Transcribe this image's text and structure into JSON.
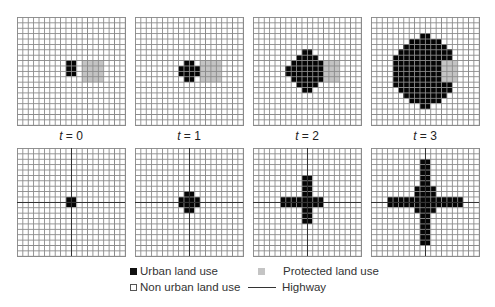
{
  "grid_size": 20,
  "colors": {
    "urban": "#050505",
    "protected": "#c4c4c4",
    "non_urban": "#ffffff",
    "grid_line": "#8a8a8a",
    "highway": "#333333"
  },
  "top_row": {
    "description": "Urban growth with protected land use",
    "panels": [
      {
        "label_var": "t",
        "label_eq": " = 0",
        "urban": {
          "8": [
            9,
            10
          ],
          "9": [
            9,
            10
          ],
          "10": [
            9,
            10
          ]
        },
        "protected_rect": {
          "row0": 8,
          "row1": 11,
          "col0": 12,
          "col1": 15
        }
      },
      {
        "label_var": "t",
        "label_eq": " = 1",
        "urban": {
          "8": [
            9,
            10
          ],
          "9": [
            8,
            11
          ],
          "10": [
            8,
            11
          ],
          "11": [
            9,
            10
          ]
        },
        "protected_rect": {
          "row0": 8,
          "row1": 11,
          "col0": 12,
          "col1": 15
        }
      },
      {
        "label_var": "t",
        "label_eq": " = 2",
        "urban": {
          "6": [
            9,
            10
          ],
          "7": [
            8,
            11
          ],
          "8": [
            7,
            12
          ],
          "9": [
            6,
            12
          ],
          "10": [
            6,
            12
          ],
          "11": [
            7,
            12
          ],
          "12": [
            8,
            11
          ],
          "13": [
            9,
            10
          ]
        },
        "protected_rect": {
          "row0": 8,
          "row1": 11,
          "col0": 13,
          "col1": 15
        }
      },
      {
        "label_var": "t",
        "label_eq": " = 3",
        "urban": {
          "3": [
            9,
            10
          ],
          "4": [
            7,
            12
          ],
          "5": [
            6,
            13
          ],
          "6": [
            5,
            14
          ],
          "7": [
            4,
            14
          ],
          "8": [
            4,
            12
          ],
          "9": [
            4,
            12
          ],
          "10": [
            4,
            12
          ],
          "11": [
            4,
            12
          ],
          "12": [
            4,
            14
          ],
          "13": [
            5,
            14
          ],
          "14": [
            6,
            13
          ],
          "15": [
            7,
            12
          ],
          "16": [
            9,
            10
          ]
        },
        "protected_rect": {
          "row0": 8,
          "row1": 11,
          "col0": 13,
          "col1": 15
        }
      }
    ]
  },
  "bottom_row": {
    "description": "Urban growth along highways",
    "panels": [
      {
        "urban": {
          "9": [
            9,
            10
          ],
          "10": [
            9,
            10
          ]
        },
        "vertical": [],
        "highway": true
      },
      {
        "urban": {
          "8": [
            9,
            10
          ],
          "9": [
            8,
            11
          ],
          "10": [
            8,
            11
          ],
          "11": [
            9,
            10
          ]
        },
        "highway": true
      },
      {
        "urban": {
          "5": [
            9,
            10
          ],
          "6": [
            9,
            10
          ],
          "7": [
            9,
            10
          ],
          "8": [
            9,
            10
          ],
          "9": [
            5,
            12
          ],
          "10": [
            5,
            12
          ],
          "11": [
            9,
            10
          ],
          "12": [
            9,
            10
          ],
          "13": [
            9,
            10
          ]
        },
        "highway": true
      },
      {
        "urban": {
          "2": [
            9,
            10
          ],
          "3": [
            9,
            10
          ],
          "4": [
            9,
            10
          ],
          "5": [
            9,
            10
          ],
          "6": [
            9,
            10
          ],
          "7": [
            8,
            11
          ],
          "8": [
            8,
            11
          ],
          "9": [
            3,
            16
          ],
          "10": [
            3,
            16
          ],
          "11": [
            8,
            11
          ],
          "12": [
            9,
            10
          ],
          "13": [
            9,
            10
          ],
          "14": [
            9,
            10
          ],
          "15": [
            9,
            10
          ],
          "16": [
            9,
            10
          ],
          "17": [
            9,
            10
          ]
        },
        "highway": true
      }
    ]
  },
  "legend": {
    "urban": "Urban land use",
    "protected": "Protected land use",
    "non_urban": "Non urban land use",
    "highway": "Highway"
  }
}
